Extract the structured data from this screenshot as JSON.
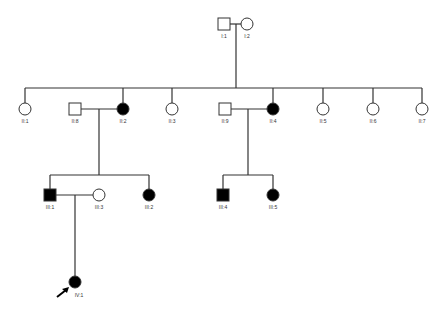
{
  "colors": {
    "line": "#333333",
    "affected": "#000000",
    "unaffected": "#ffffff"
  },
  "individuals": [
    {
      "id": "I:1",
      "sex": "male",
      "affected": false,
      "x": 224,
      "y": 24
    },
    {
      "id": "I:2",
      "sex": "female",
      "affected": false,
      "x": 247,
      "y": 24
    },
    {
      "id": "II:1",
      "sex": "female",
      "affected": false,
      "x": 25,
      "y": 109
    },
    {
      "id": "II:8",
      "sex": "male",
      "affected": false,
      "x": 75,
      "y": 109
    },
    {
      "id": "II:2",
      "sex": "female",
      "affected": true,
      "x": 123,
      "y": 109
    },
    {
      "id": "II:3",
      "sex": "female",
      "affected": false,
      "x": 172,
      "y": 109
    },
    {
      "id": "II:9",
      "sex": "male",
      "affected": false,
      "x": 225,
      "y": 109
    },
    {
      "id": "II:4",
      "sex": "female",
      "affected": true,
      "x": 273,
      "y": 109
    },
    {
      "id": "II:5",
      "sex": "female",
      "affected": false,
      "x": 323,
      "y": 109
    },
    {
      "id": "II:6",
      "sex": "female",
      "affected": false,
      "x": 373,
      "y": 109
    },
    {
      "id": "II:7",
      "sex": "female",
      "affected": false,
      "x": 422,
      "y": 109
    },
    {
      "id": "III:1",
      "sex": "male",
      "affected": true,
      "x": 50,
      "y": 195
    },
    {
      "id": "III:3",
      "sex": "female",
      "affected": false,
      "x": 99,
      "y": 195
    },
    {
      "id": "III:2",
      "sex": "female",
      "affected": true,
      "x": 149,
      "y": 195
    },
    {
      "id": "III:4",
      "sex": "male",
      "affected": true,
      "x": 223,
      "y": 195
    },
    {
      "id": "III:5",
      "sex": "female",
      "affected": true,
      "x": 273,
      "y": 195
    },
    {
      "id": "IV:1",
      "sex": "female",
      "affected": true,
      "x": 75,
      "y": 282,
      "proband": true
    }
  ],
  "proband_marker": "arrow"
}
